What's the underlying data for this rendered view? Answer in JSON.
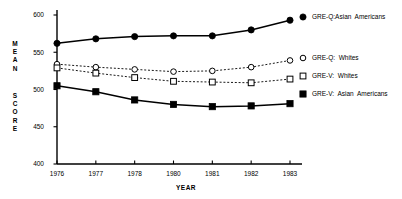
{
  "chart_data": {
    "type": "line",
    "title": "",
    "xlabel": "YEAR",
    "ylabel": "MEAN SCORE",
    "ylabel_lines": [
      "MEAN",
      "SCORE"
    ],
    "x": [
      1976,
      1977,
      1978,
      1980,
      1981,
      1982,
      1983
    ],
    "categories": [
      "1976",
      "1977",
      "1978",
      "1980",
      "1981",
      "1982",
      "1983"
    ],
    "xtick_labels": [
      "1976",
      "1977",
      "1978",
      "1980",
      "1981",
      "1982",
      "1983"
    ],
    "ytick_labels": [
      "600",
      "550",
      "500",
      "450",
      "400"
    ],
    "yticks": [
      600,
      550,
      500,
      450,
      400
    ],
    "ylim": [
      400,
      600
    ],
    "grid": false,
    "legend_position": "right",
    "series": [
      {
        "name": "GRE-Q:Asian Americans",
        "marker": "filled-circle",
        "line": "solid",
        "color": "#000000",
        "values": [
          562,
          568,
          571,
          572,
          572,
          580,
          593
        ]
      },
      {
        "name": "GRE-Q: Whites",
        "marker": "open-circle",
        "line": "dashed",
        "color": "#000000",
        "values": [
          534,
          530,
          527,
          524,
          525,
          530,
          539
        ]
      },
      {
        "name": "GRE-V: Whites",
        "marker": "open-square",
        "line": "dashed",
        "color": "#000000",
        "values": [
          529,
          522,
          516,
          511,
          510,
          509,
          514
        ]
      },
      {
        "name": "GRE-V: Asian Americans",
        "marker": "filled-square",
        "line": "solid",
        "color": "#000000",
        "values": [
          505,
          497,
          486,
          480,
          477,
          478,
          481
        ]
      }
    ]
  },
  "legend": {
    "items": [
      {
        "label": "GRE-Q:Asian  Americans",
        "marker": "filled-circle"
      },
      {
        "label": "GRE-Q:  Whites",
        "marker": "open-circle"
      },
      {
        "label": "GRE-V:  Whites",
        "marker": "open-square"
      },
      {
        "label": "GRE-V:  Asian  Americans",
        "marker": "filled-square"
      }
    ]
  }
}
